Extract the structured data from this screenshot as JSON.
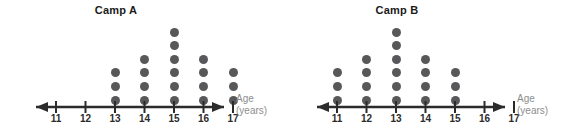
{
  "chart_data": [
    {
      "type": "dotplot",
      "title": "Camp A",
      "xlabel": "Age",
      "xlabel_unit": "(years)",
      "ylabel": "",
      "categories": [
        "11",
        "12",
        "13",
        "14",
        "15",
        "16",
        "17"
      ],
      "values": [
        0,
        0,
        3,
        4,
        6,
        4,
        3
      ],
      "xlim": [
        11,
        17
      ],
      "grid": false,
      "legend": "none",
      "dot_color": "#58585a",
      "axis_color": "#2b2b2b",
      "axis_arrows": "both"
    },
    {
      "type": "dotplot",
      "title": "Camp B",
      "xlabel": "Age",
      "xlabel_unit": "(years)",
      "ylabel": "",
      "categories": [
        "11",
        "12",
        "13",
        "14",
        "15",
        "16",
        "17"
      ],
      "values": [
        3,
        4,
        6,
        4,
        3,
        0,
        0
      ],
      "xlim": [
        11,
        17
      ],
      "grid": false,
      "legend": "none",
      "dot_color": "#58585a",
      "axis_color": "#2b2b2b",
      "axis_arrows": "both"
    }
  ],
  "plots": [
    {
      "id": "camp-a",
      "title": "Camp A",
      "axis_caption_line1": "Age",
      "axis_caption_line2": "(years)",
      "ticks": [
        "11",
        "12",
        "13",
        "14",
        "15",
        "16",
        "17"
      ],
      "counts": [
        0,
        0,
        3,
        4,
        6,
        4,
        3
      ]
    },
    {
      "id": "camp-b",
      "title": "Camp B",
      "axis_caption_line1": "Age",
      "axis_caption_line2": "(years)",
      "ticks": [
        "11",
        "12",
        "13",
        "14",
        "15",
        "16",
        "17"
      ],
      "counts": [
        3,
        4,
        6,
        4,
        3,
        0,
        0
      ]
    }
  ],
  "colors": {
    "dot": "#58585a",
    "axis": "#2b2b2b",
    "title": "#1a1a1a",
    "caption": "#8d8d8d",
    "background": "#ffffff"
  }
}
